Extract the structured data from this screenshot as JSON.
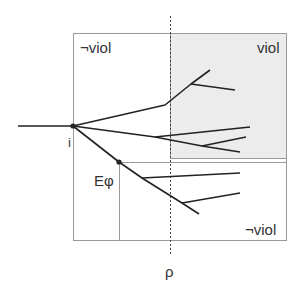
{
  "diagram": {
    "labels": {
      "not_viol_top": "¬viol",
      "viol": "viol",
      "not_viol_bottom": "¬viol",
      "node_i": "i",
      "e_phi": "Eφ",
      "rho": "ρ"
    },
    "regions": {
      "outer_box": {
        "x": 73,
        "y": 33,
        "w": 213,
        "h": 207
      },
      "viol_region": {
        "x": 170,
        "y": 33,
        "w": 116,
        "h": 125,
        "fill": "#ececec"
      },
      "not_viol_lower_region": {
        "x": 119,
        "y": 162,
        "w": 167,
        "h": 78
      }
    },
    "rho_line": {
      "x": 170,
      "y1": 16,
      "y2": 256
    },
    "stem": {
      "x1": 18,
      "y1": 126,
      "x2": 73,
      "y2": 126
    },
    "nodes": [
      {
        "name": "i",
        "x": 73,
        "y": 126
      },
      {
        "name": "e-phi",
        "x": 119,
        "y": 162
      }
    ],
    "branches": [
      [
        [
          73,
          126
        ],
        [
          165,
          105
        ],
        [
          191,
          84
        ],
        [
          210,
          70
        ]
      ],
      [
        [
          191,
          84
        ],
        [
          235,
          90
        ]
      ],
      [
        [
          73,
          126
        ],
        [
          155,
          137
        ],
        [
          250,
          127
        ]
      ],
      [
        [
          155,
          137
        ],
        [
          202,
          146
        ],
        [
          240,
          152
        ]
      ],
      [
        [
          202,
          146
        ],
        [
          246,
          137
        ]
      ],
      [
        [
          73,
          126
        ],
        [
          119,
          162
        ],
        [
          142,
          178
        ],
        [
          182,
          203
        ],
        [
          199,
          214
        ]
      ],
      [
        [
          142,
          178
        ],
        [
          240,
          173
        ]
      ],
      [
        [
          182,
          203
        ],
        [
          240,
          193
        ]
      ]
    ],
    "colors": {
      "line": "#222222",
      "box_border": "#9a9a9a",
      "viol_fill": "#ececec",
      "text": "#333333"
    }
  }
}
